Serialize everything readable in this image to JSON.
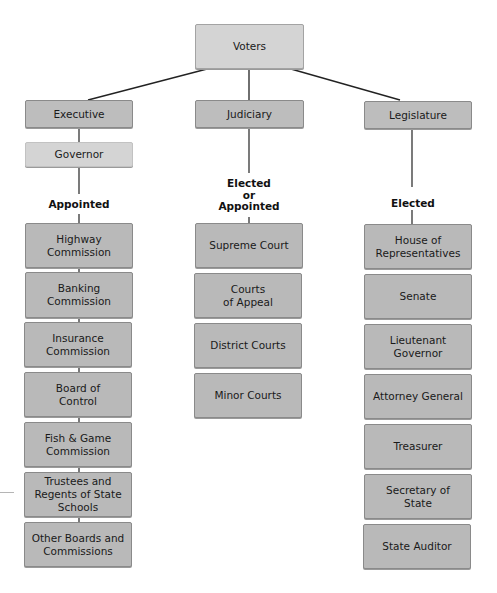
{
  "diagram": {
    "root": {
      "label": "Voters"
    },
    "branches": [
      {
        "label": "Executive",
        "sub": {
          "label": "Governor"
        },
        "selection": "Appointed",
        "offices": [
          "Highway\nCommission",
          "Banking\nCommission",
          "Insurance\nCommission",
          "Board of\nControl",
          "Fish & Game\nCommission",
          "Trustees and\nRegents of State\nSchools",
          "Other Boards and\nCommissions"
        ]
      },
      {
        "label": "Judiciary",
        "selection": "Elected\nor\nAppointed",
        "offices": [
          "Supreme Court",
          "Courts\nof Appeal",
          "District Courts",
          "Minor Courts"
        ]
      },
      {
        "label": "Legislature",
        "selection": "Elected",
        "offices": [
          "House of\nRepresentatives",
          "Senate",
          "Lieutenant\nGovernor",
          "Attorney General",
          "Treasurer",
          "Secretary of\nState",
          "State Auditor"
        ]
      }
    ],
    "colors": {
      "box_fill": "#b9b9b9",
      "light_box_fill": "#d4d4d4",
      "line": "#222222"
    }
  }
}
